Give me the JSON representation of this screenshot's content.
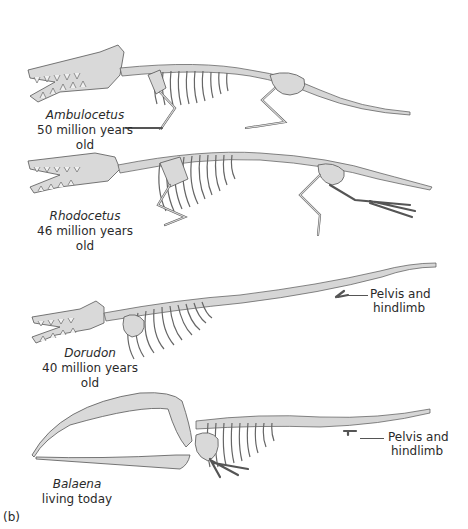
{
  "figure": {
    "panel_label": "(b)",
    "bone_color": "#d9d9d9",
    "outline_color": "#555555",
    "background": "#ffffff",
    "specimens": [
      {
        "genus": "Ambulocetus",
        "age": "50 million years old"
      },
      {
        "genus": "Rhodocetus",
        "age": "46 million years old"
      },
      {
        "genus": "Dorudon",
        "age": "40 million years old",
        "callout": {
          "line1": "Pelvis and",
          "line2": "hindlimb"
        }
      },
      {
        "genus": "Balaena",
        "age": "living today",
        "callout": {
          "line1": "Pelvis and",
          "line2": "hindlimb"
        }
      }
    ]
  }
}
